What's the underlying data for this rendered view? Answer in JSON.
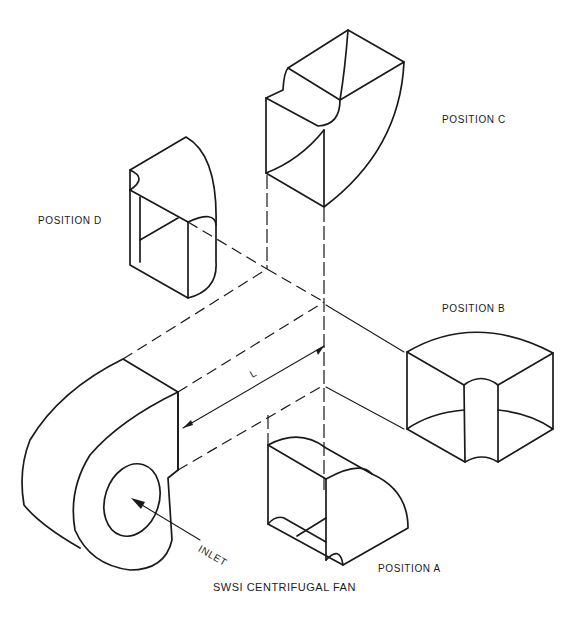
{
  "diagram": {
    "title": "SWSI CENTRIFUGAL FAN",
    "colors": {
      "ink": "#1a1a1a",
      "background": "#ffffff"
    },
    "labels": {
      "position_a": "POSITION A",
      "position_b": "POSITION B",
      "position_c": "POSITION C",
      "position_d": "POSITION D",
      "inlet": "INLET",
      "dimension": "L"
    },
    "components": [
      {
        "id": "fan",
        "name": "SWSI centrifugal fan housing",
        "label_ref": "title"
      },
      {
        "id": "elbow-a",
        "name": "Elbow at position A (below outlet)",
        "label_ref": "position_a"
      },
      {
        "id": "elbow-b",
        "name": "Elbow at position B (right of outlet)",
        "label_ref": "position_b"
      },
      {
        "id": "elbow-c",
        "name": "Elbow at position C (above outlet)",
        "label_ref": "position_c"
      },
      {
        "id": "elbow-d",
        "name": "Elbow at position D (left-upper of outlet)",
        "label_ref": "position_d"
      }
    ],
    "annotations": [
      {
        "type": "dimension",
        "text_ref": "dimension",
        "meaning": "distance from fan outlet to elbow"
      },
      {
        "type": "arrow",
        "text_ref": "inlet",
        "points_to": "fan inlet opening"
      }
    ]
  }
}
